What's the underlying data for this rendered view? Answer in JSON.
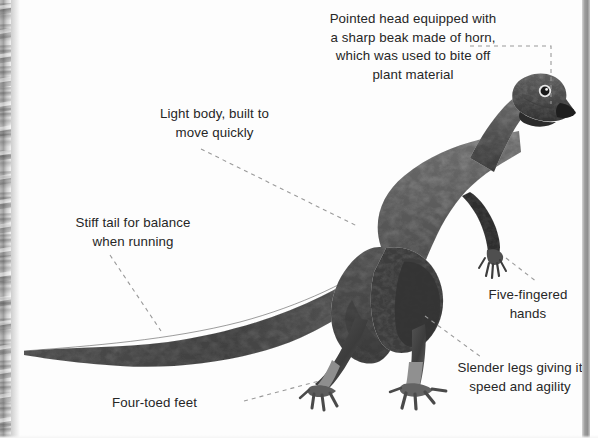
{
  "page": {
    "background_color": "#ffffff",
    "text_color": "#262626",
    "leader_line_color": "#9a9a9a",
    "artwork_color": "#6e6e6e"
  },
  "diagram": {
    "labels": [
      {
        "id": "head",
        "name": "pointed-head-label",
        "text": "Pointed head equipped with\na sharp beak made of horn,\nwhich was used to bite off\nplant material",
        "align": "center"
      },
      {
        "id": "body",
        "name": "light-body-label",
        "text": "Light body, built to\nmove quickly",
        "align": "center"
      },
      {
        "id": "tail",
        "name": "stiff-tail-label",
        "text": "Stiff tail for balance\nwhen running",
        "align": "center"
      },
      {
        "id": "hands",
        "name": "five-fingered-hands-label",
        "text": "Five-fingered\nhands",
        "align": "center"
      },
      {
        "id": "legs",
        "name": "slender-legs-label",
        "text": "Slender legs giving it\nspeed and agility",
        "align": "center"
      },
      {
        "id": "feet",
        "name": "four-toed-feet-label",
        "text": "Four-toed feet",
        "align": "left"
      }
    ]
  }
}
